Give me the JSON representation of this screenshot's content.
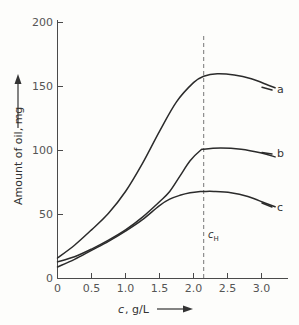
{
  "chart_data": {
    "type": "line",
    "title": "",
    "xlabel": "c, g/L",
    "ylabel": "Amount of oil, mg",
    "xlim": [
      0,
      3.4
    ],
    "ylim": [
      0,
      200
    ],
    "grid": false,
    "legend": "inline-right-end-labels",
    "x_ticks": [
      "0",
      "0.5",
      "1.0",
      "1.5",
      "2.0",
      "2.5",
      "3.0"
    ],
    "x_tick_values": [
      0,
      0.5,
      1.0,
      1.5,
      2.0,
      2.5,
      3.0
    ],
    "y_ticks": [
      "0",
      "50",
      "100",
      "150",
      "200"
    ],
    "y_tick_values": [
      0,
      50,
      100,
      150,
      200
    ],
    "annotations": [
      {
        "name": "critical-concentration",
        "label_base": "c",
        "label_sub": "H",
        "x": 2.15,
        "style": "vertical-dashed-line"
      }
    ],
    "series": [
      {
        "name": "a",
        "label": "a",
        "x": [
          0.0,
          0.25,
          0.5,
          0.75,
          1.0,
          1.25,
          1.5,
          1.75,
          2.0,
          2.15,
          2.35,
          2.6,
          2.85,
          3.1,
          3.2
        ],
        "values": [
          16,
          26,
          38,
          51,
          68,
          90,
          115,
          138,
          153,
          158,
          160,
          159,
          156,
          151,
          149
        ]
      },
      {
        "name": "b",
        "label": "b",
        "x": [
          0.0,
          0.25,
          0.5,
          0.75,
          1.0,
          1.25,
          1.5,
          1.65,
          1.8,
          1.95,
          2.1,
          2.15,
          2.4,
          2.7,
          3.0,
          3.2
        ],
        "values": [
          13,
          17,
          23,
          30,
          38,
          48,
          60,
          68,
          80,
          92,
          100,
          101,
          102,
          101,
          98,
          95
        ]
      },
      {
        "name": "c",
        "label": "c",
        "x": [
          0.0,
          0.25,
          0.5,
          0.75,
          1.0,
          1.25,
          1.5,
          1.65,
          1.8,
          1.95,
          2.1,
          2.15,
          2.3,
          2.55,
          2.8,
          3.05,
          3.2
        ],
        "values": [
          9,
          15,
          22,
          29,
          37,
          46,
          57,
          62,
          65,
          67,
          68,
          68,
          68,
          67,
          64,
          59,
          56
        ]
      }
    ]
  },
  "axis": {
    "y_title": "Amount of oil, mg",
    "x_title_italic": "c",
    "x_title_rest": ", g/L"
  }
}
